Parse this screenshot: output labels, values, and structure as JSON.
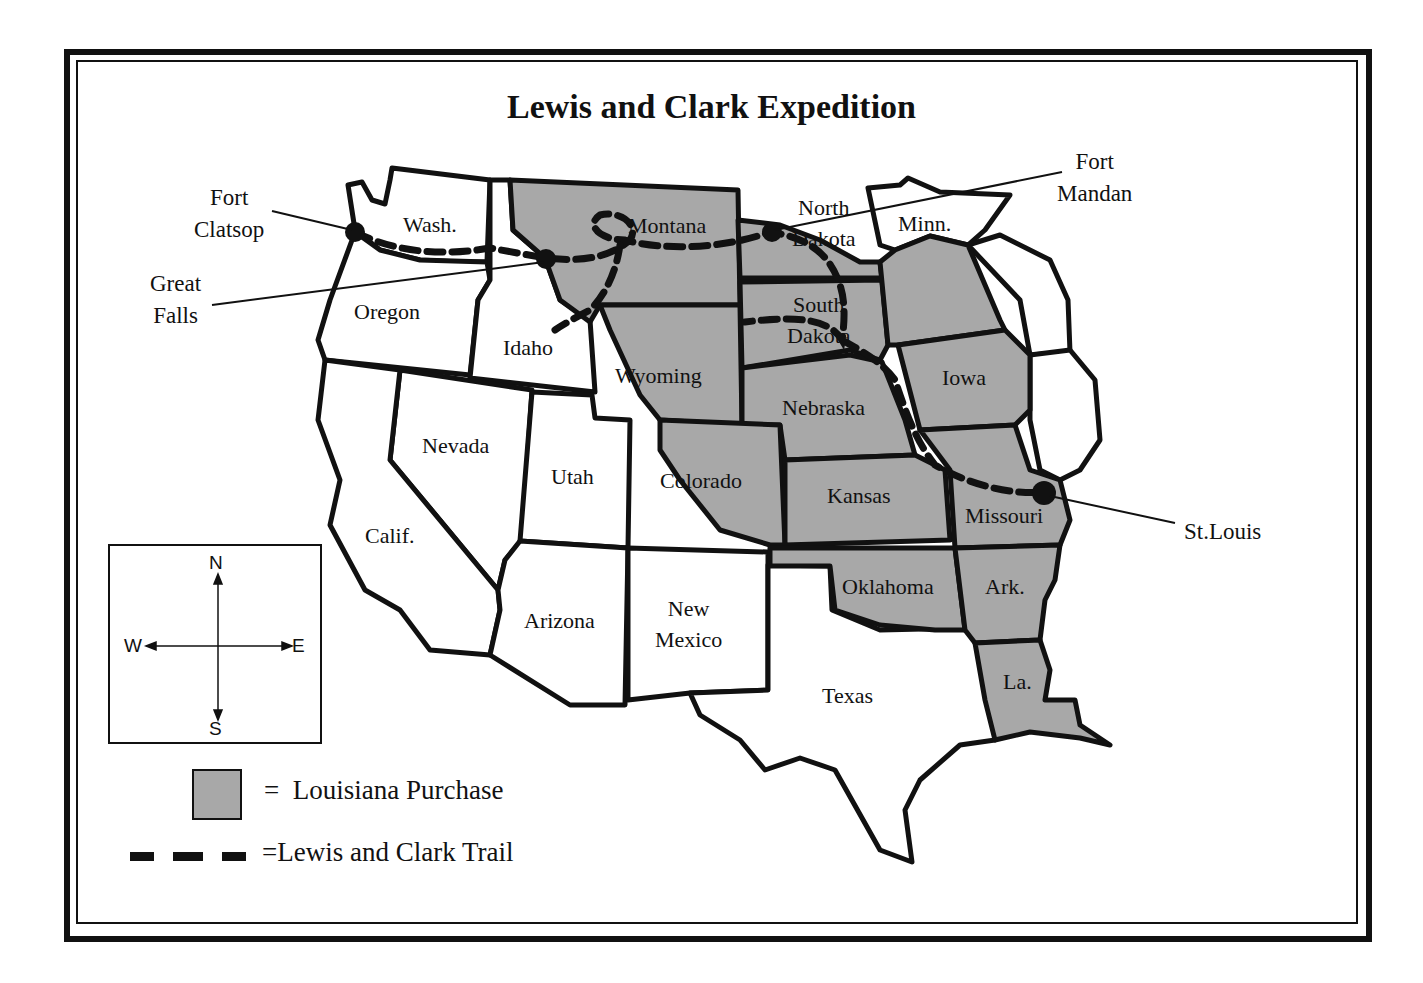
{
  "title": "Lewis and Clark Expedition",
  "colors": {
    "louisiana_purchase_fill": "#a8a8a8",
    "outline": "#111111",
    "background": "#ffffff"
  },
  "states": [
    {
      "id": "wash",
      "label": "Wash.",
      "in_purchase": false
    },
    {
      "id": "oregon",
      "label": "Oregon",
      "in_purchase": false
    },
    {
      "id": "idaho",
      "label": "Idaho",
      "in_purchase": false
    },
    {
      "id": "montana",
      "label": "Montana",
      "in_purchase": true
    },
    {
      "id": "wyoming",
      "label": "Wyoming",
      "in_purchase": "partial"
    },
    {
      "id": "north_dakota",
      "label": "North Dakota",
      "line1": "North",
      "line2": "Dakota",
      "in_purchase": "partial"
    },
    {
      "id": "south_dakota",
      "label": "South Dakota",
      "line1": "South",
      "line2": "Dakota",
      "in_purchase": true
    },
    {
      "id": "minn",
      "label": "Minn.",
      "in_purchase": "partial"
    },
    {
      "id": "nebraska",
      "label": "Nebraska",
      "in_purchase": true
    },
    {
      "id": "iowa",
      "label": "Iowa",
      "in_purchase": true
    },
    {
      "id": "nevada",
      "label": "Nevada",
      "in_purchase": false
    },
    {
      "id": "utah",
      "label": "Utah",
      "in_purchase": false
    },
    {
      "id": "colorado",
      "label": "Colorado",
      "in_purchase": "partial"
    },
    {
      "id": "kansas",
      "label": "Kansas",
      "in_purchase": true
    },
    {
      "id": "missouri",
      "label": "Missouri",
      "in_purchase": true
    },
    {
      "id": "calif",
      "label": "Calif.",
      "in_purchase": false
    },
    {
      "id": "arizona",
      "label": "Arizona",
      "in_purchase": false
    },
    {
      "id": "new_mexico",
      "label": "New Mexico",
      "line1": "New",
      "line2": "Mexico",
      "in_purchase": false
    },
    {
      "id": "oklahoma",
      "label": "Oklahoma",
      "in_purchase": true
    },
    {
      "id": "ark",
      "label": "Ark.",
      "in_purchase": true
    },
    {
      "id": "texas",
      "label": "Texas",
      "in_purchase": false
    },
    {
      "id": "la",
      "label": "La.",
      "in_purchase": true
    }
  ],
  "locations": [
    {
      "id": "fort_clatsop",
      "line1": "Fort",
      "line2": "Clatsop"
    },
    {
      "id": "great_falls",
      "line1": "Great",
      "line2": "Falls"
    },
    {
      "id": "fort_mandan",
      "line1": "Fort",
      "line2": "Mandan"
    },
    {
      "id": "st_louis",
      "line1": "St.Louis"
    }
  ],
  "compass": {
    "north": "N",
    "south": "S",
    "east": "E",
    "west": "W"
  },
  "legend": {
    "purchase": {
      "symbol": "=",
      "label": "Louisiana Purchase"
    },
    "trail": {
      "symbol": "=",
      "label": "Lewis and Clark Trail"
    }
  }
}
